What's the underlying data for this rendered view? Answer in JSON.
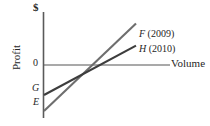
{
  "chart_data": {
    "type": "line",
    "title": "",
    "xlabel": "Volume",
    "ylabel": "Profit",
    "y_unit_label": "$",
    "zero_label": "0",
    "xlim": [
      0,
      100
    ],
    "ylim": [
      -60,
      60
    ],
    "grid": false,
    "legend_position": "right-inline",
    "axis_color": "#5a5a5a",
    "zero_line_color": "#8c8c8c",
    "series": [
      {
        "name": "F (2009)",
        "label_symbol": "F",
        "label_year": "(2009)",
        "color": "#6e6e6e",
        "intercept_label": "E",
        "x": [
          0,
          100
        ],
        "y": [
          -52,
          47
        ]
      },
      {
        "name": "H (2010)",
        "label_symbol": "H",
        "label_year": "(2010)",
        "color": "#3d3d3d",
        "intercept_label": "G",
        "x": [
          0,
          100
        ],
        "y": [
          -34,
          22
        ]
      }
    ],
    "annotations": [
      {
        "text": "E",
        "meaning": "y-intercept of line F (2009)"
      },
      {
        "text": "G",
        "meaning": "y-intercept of line H (2010)"
      }
    ]
  },
  "axes": {
    "y_unit_label": "$",
    "y_title": "Profit",
    "zero_tick": "0",
    "x_title": "Volume"
  },
  "legend": {
    "items": [
      {
        "symbol": "F",
        "year": "(2009)"
      },
      {
        "symbol": "H",
        "year": "(2010)"
      }
    ]
  },
  "intercepts": {
    "upper": "G",
    "lower": "E"
  }
}
